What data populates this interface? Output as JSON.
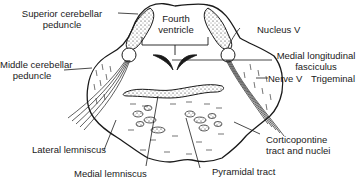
{
  "diagram": {
    "labels": {
      "superior_cerebellar_peduncle": [
        "Superior cerebellar",
        "peduncle"
      ],
      "fourth_ventricle": [
        "Fourth",
        "ventricle"
      ],
      "nucleus_v": "Nucleus V",
      "medial_longitudinal_fasciculus": [
        "Medial longitudinal",
        "fasciculus"
      ],
      "middle_cerebellar_peduncle": [
        "Middle cerebellar",
        "peduncle"
      ],
      "nerve_v": "Nerve V",
      "trigeminal": "Trigeminal",
      "lateral_lemniscus": "Lateral lemniscus",
      "medial_lemniscus": "Medial lemniscus",
      "pyramidal_tract": "Pyramidal tract",
      "corticopontine": [
        "Corticopontine",
        "tract and nuclei"
      ]
    },
    "colors": {
      "ink": "#1a1a1a",
      "background": "#ffffff"
    }
  }
}
